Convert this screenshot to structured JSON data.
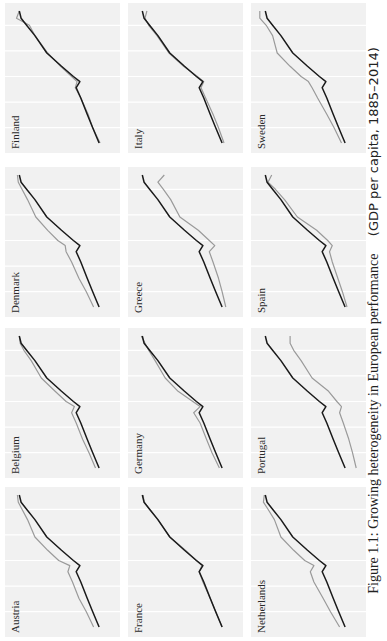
{
  "figure": {
    "caption_main": "Figure 1.1: Growing heterogeneity in European performance",
    "caption_sub": "(GDP per capita, 1885–2014)"
  },
  "colors": {
    "panel_bg": "#f1f1f1",
    "gridline": "#ffffff",
    "benchmark_line": "#1a1a1a",
    "country_line": "#9a9a9a"
  },
  "chart_data": {
    "type": "line",
    "title": "Figure 1.1: Growing heterogeneity in European performance (GDP per capita, 1885–2014)",
    "xlabel": "",
    "ylabel": "",
    "x_range": [
      1885,
      2014
    ],
    "grid": true,
    "legend": "none",
    "layout": "small multiples, 3 rows × 4 columns",
    "note": "Black line = common benchmark (same in every panel); grey line = named country. Values are relative positions read from the panels (0 = bottom, 100 = top), no axis ticks shown.",
    "x": [
      1885,
      1900,
      1913,
      1929,
      1939,
      1945,
      1950,
      1960,
      1973,
      1990,
      2000,
      2007,
      2014
    ],
    "benchmark": [
      6,
      13,
      19,
      26,
      31,
      27,
      34,
      47,
      63,
      76,
      85,
      91,
      93
    ],
    "panels": [
      {
        "country": "Austria",
        "values": [
          12,
          20,
          28,
          35,
          40,
          38,
          50,
          62,
          76,
          84,
          90,
          94,
          95
        ]
      },
      {
        "country": "Belgium",
        "values": [
          10,
          17,
          24,
          31,
          36,
          33,
          42,
          54,
          69,
          80,
          88,
          92,
          93
        ]
      },
      {
        "country": "Denmark",
        "values": [
          12,
          20,
          28,
          36,
          42,
          43,
          51,
          62,
          75,
          84,
          90,
          94,
          95
        ]
      },
      {
        "country": "Finland",
        "values": [
          5,
          13,
          18,
          26,
          32,
          30,
          36,
          48,
          62,
          76,
          82,
          96,
          93
        ]
      },
      {
        "country": "France",
        "values": [
          6,
          13,
          19,
          27,
          31,
          28,
          34,
          46,
          63,
          76,
          85,
          91,
          92
        ]
      },
      {
        "country": "Germany",
        "values": [
          9,
          17,
          23,
          30,
          37,
          30,
          38,
          54,
          68,
          79,
          86,
          90,
          94
        ]
      },
      {
        "country": "Greece",
        "values": [
          2,
          6,
          10,
          16,
          20,
          14,
          20,
          32,
          52,
          62,
          70,
          76,
          69
        ]
      },
      {
        "country": "Italy",
        "values": [
          4,
          10,
          16,
          24,
          29,
          26,
          33,
          48,
          64,
          77,
          86,
          90,
          88
        ]
      },
      {
        "country": "Netherlands",
        "values": [
          12,
          22,
          30,
          40,
          44,
          40,
          50,
          62,
          76,
          83,
          90,
          95,
          94
        ]
      },
      {
        "country": "Portugal",
        "values": [
          -6,
          -2,
          2,
          8,
          12,
          10,
          15,
          24,
          42,
          54,
          62,
          66,
          66
        ]
      },
      {
        "country": "Spain",
        "values": [
          4,
          9,
          14,
          20,
          23,
          20,
          25,
          37,
          58,
          72,
          82,
          90,
          86
        ]
      },
      {
        "country": "Sweden",
        "values": [
          10,
          18,
          26,
          36,
          42,
          46,
          54,
          66,
          80,
          85,
          92,
          99,
          99
        ]
      }
    ]
  }
}
